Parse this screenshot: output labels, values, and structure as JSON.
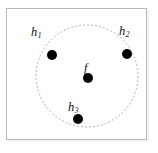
{
  "figure": {
    "type": "diagram",
    "title": "",
    "canvas": {
      "width": 158,
      "height": 153
    },
    "background_color": "#fefefe",
    "frame": {
      "name": "figure-border",
      "x": 6,
      "y": 8,
      "width": 141,
      "height": 132,
      "stroke_color": "#b9b9b9",
      "fill_color": "#fefefe",
      "stroke_width": 1
    },
    "circle": {
      "name": "dashed-boundary-circle",
      "center_x": 87,
      "center_y": 76,
      "radius": 51,
      "stroke_color": "#a9a9a9",
      "stroke_width": 0.9,
      "dash_pattern": "2,2",
      "fill": "none"
    },
    "points": [
      {
        "id": "h1",
        "label": "h",
        "subscript": "1",
        "cx": 52,
        "cy": 55,
        "r": 5,
        "color": "#000000",
        "label_x": 31,
        "label_y": 26
      },
      {
        "id": "h2",
        "label": "h",
        "subscript": "2",
        "cx": 127,
        "cy": 54,
        "r": 5,
        "color": "#000000",
        "label_x": 119,
        "label_y": 25
      },
      {
        "id": "h3",
        "label": "h",
        "subscript": "3",
        "cx": 78,
        "cy": 119,
        "r": 5,
        "color": "#000000",
        "label_x": 68,
        "label_y": 101
      },
      {
        "id": "f",
        "label": "f",
        "subscript": "",
        "cx": 88,
        "cy": 78,
        "r": 5,
        "color": "#000000",
        "label_x": 84,
        "label_y": 62
      }
    ]
  }
}
